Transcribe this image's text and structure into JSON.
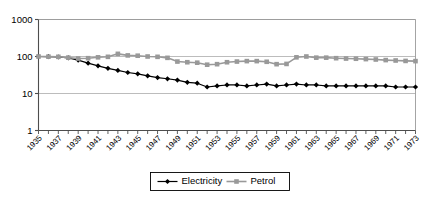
{
  "chart_data": {
    "type": "line",
    "title": "",
    "xlabel": "",
    "ylabel": "",
    "yscale": "log",
    "ylim": [
      1,
      1000
    ],
    "ytick_labels": [
      "1000",
      "100",
      "10",
      "1"
    ],
    "ytick_values": [
      1000,
      100,
      10,
      1
    ],
    "grid": true,
    "legend_position": "bottom-center",
    "x": [
      1935,
      1936,
      1937,
      1938,
      1939,
      1940,
      1941,
      1942,
      1943,
      1944,
      1945,
      1946,
      1947,
      1948,
      1949,
      1950,
      1951,
      1952,
      1953,
      1954,
      1955,
      1956,
      1957,
      1958,
      1959,
      1960,
      1961,
      1962,
      1963,
      1964,
      1965,
      1966,
      1967,
      1968,
      1969,
      1970,
      1971,
      1972,
      1973
    ],
    "xtick_labels": [
      "1935",
      "1937",
      "1939",
      "1941",
      "1943",
      "1945",
      "1947",
      "1949",
      "1951",
      "1953",
      "1955",
      "1957",
      "1959",
      "1961",
      "1963",
      "1965",
      "1967",
      "1969",
      "1971",
      "1973"
    ],
    "series": [
      {
        "name": "Electricity",
        "color": "#000000",
        "marker": "diamond",
        "values": [
          100,
          99,
          97,
          92,
          80,
          66,
          56,
          48,
          42,
          37,
          34,
          30,
          27,
          25,
          23,
          20,
          19,
          15,
          16,
          17,
          17,
          16,
          17,
          18,
          16,
          17,
          18,
          17,
          17,
          16,
          16,
          16,
          16,
          16,
          16,
          16,
          15,
          15,
          15
        ]
      },
      {
        "name": "Petrol",
        "color": "#999999",
        "marker": "square",
        "values": [
          100,
          99,
          98,
          93,
          88,
          90,
          95,
          98,
          118,
          107,
          105,
          100,
          98,
          92,
          73,
          70,
          68,
          60,
          62,
          70,
          73,
          75,
          75,
          72,
          62,
          63,
          95,
          100,
          93,
          93,
          90,
          88,
          87,
          85,
          83,
          80,
          78,
          76,
          75
        ]
      }
    ]
  },
  "legend": {
    "items": [
      {
        "label": "Electricity"
      },
      {
        "label": "Petrol"
      }
    ]
  }
}
